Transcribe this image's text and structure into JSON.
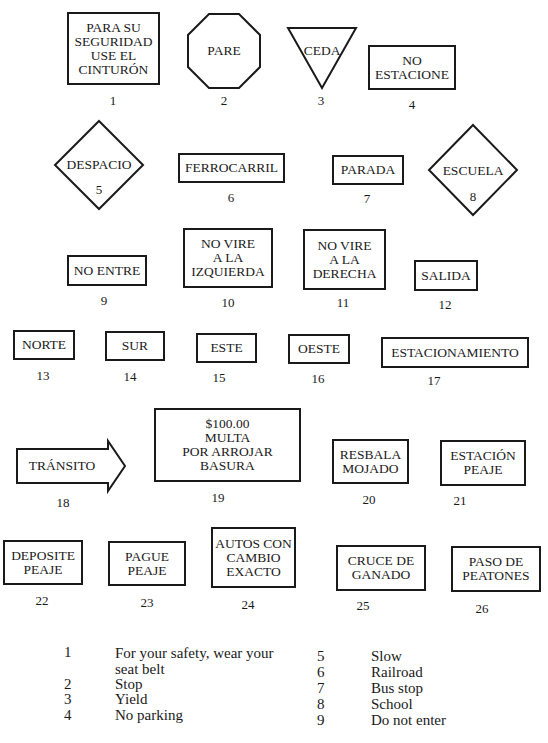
{
  "signs": [
    {
      "number": "1",
      "text": "PARA SU\nSEGURIDAD\nUSE EL\nCINTURÓN",
      "shape": "rectangle"
    },
    {
      "number": "2",
      "text": "PARE",
      "shape": "octagon"
    },
    {
      "number": "3",
      "text": "CEDA",
      "shape": "inverted-triangle"
    },
    {
      "number": "4",
      "text": "NO\nESTACIONE",
      "shape": "rectangle"
    },
    {
      "number": "5",
      "text": "DESPACIO",
      "shape": "diamond"
    },
    {
      "number": "6",
      "text": "FERROCARRIL",
      "shape": "rectangle"
    },
    {
      "number": "7",
      "text": "PARADA",
      "shape": "rectangle"
    },
    {
      "number": "8",
      "text": "ESCUELA",
      "shape": "diamond"
    },
    {
      "number": "9",
      "text": "NO ENTRE",
      "shape": "rectangle"
    },
    {
      "number": "10",
      "text": "NO VIRE\n A LA\nIZQUIERDA",
      "shape": "rectangle"
    },
    {
      "number": "11",
      "text": "NO VIRE\nA LA\nDERECHA",
      "shape": "rectangle"
    },
    {
      "number": "12",
      "text": "SALIDA",
      "shape": "rectangle"
    },
    {
      "number": "13",
      "text": "NORTE",
      "shape": "rectangle"
    },
    {
      "number": "14",
      "text": "SUR",
      "shape": "rectangle"
    },
    {
      "number": "15",
      "text": "ESTE",
      "shape": "rectangle"
    },
    {
      "number": "16",
      "text": "OESTE",
      "shape": "rectangle"
    },
    {
      "number": "17",
      "text": "ESTACIONAMIENTO",
      "shape": "rectangle"
    },
    {
      "number": "18",
      "text": "TRÁNSITO",
      "shape": "arrow-right"
    },
    {
      "number": "19",
      "text": "$100.00\nMULTA\nPOR ARROJAR\nBASURA",
      "shape": "rectangle"
    },
    {
      "number": "20",
      "text": "RESBALA\nMOJADO",
      "shape": "rectangle"
    },
    {
      "number": "21",
      "text": "ESTACIÓN\nPEAJE",
      "shape": "rectangle"
    },
    {
      "number": "22",
      "text": "DEPOSITE\nPEAJE",
      "shape": "rectangle"
    },
    {
      "number": "23",
      "text": "PAGUE\nPEAJE",
      "shape": "rectangle"
    },
    {
      "number": "24",
      "text": "AUTOS CON\nCAMBIO\nEXACTO",
      "shape": "rectangle"
    },
    {
      "number": "25",
      "text": "CRUCE DE\nGANADO",
      "shape": "rectangle"
    },
    {
      "number": "26",
      "text": "PASO DE\nPEATONES",
      "shape": "rectangle"
    }
  ],
  "legend": {
    "left": [
      {
        "number": "1",
        "text": "For your safety, wear your",
        "text2": "seat belt"
      },
      {
        "number": "2",
        "text": "Stop"
      },
      {
        "number": "3",
        "text": "Yield"
      },
      {
        "number": "4",
        "text": "No parking"
      }
    ],
    "right": [
      {
        "number": "5",
        "text": "Slow"
      },
      {
        "number": "6",
        "text": "Railroad"
      },
      {
        "number": "7",
        "text": "Bus stop"
      },
      {
        "number": "8",
        "text": "School"
      },
      {
        "number": "9",
        "text": "Do not enter"
      }
    ]
  }
}
